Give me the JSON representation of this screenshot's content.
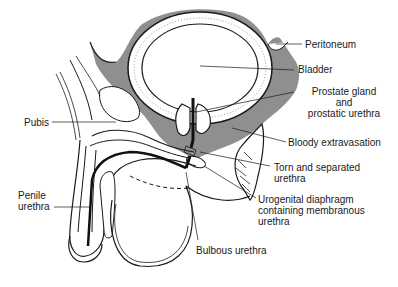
{
  "figure": {
    "colors": {
      "shading": "#8f8f8f",
      "line": "#1a1a1a",
      "background": "#ffffff",
      "bladder_fill": "#ffffff"
    }
  },
  "labels": {
    "peritoneum": "Peritoneum",
    "bladder": "Bladder",
    "prostate_line1": "Prostate gland",
    "prostate_line2": "and",
    "prostate_line3": "prostatic urethra",
    "bloody_extravasation": "Bloody extravasation",
    "torn_line1": "Torn and separated",
    "torn_line2": "urethra",
    "urogenital_line1": "Urogenital diaphragm",
    "urogenital_line2": "containing membranous",
    "urogenital_line3": "urethra",
    "bulbous_urethra": "Bulbous urethra",
    "pubis": "Pubis",
    "penile_line1": "Penile",
    "penile_line2": "urethra"
  }
}
